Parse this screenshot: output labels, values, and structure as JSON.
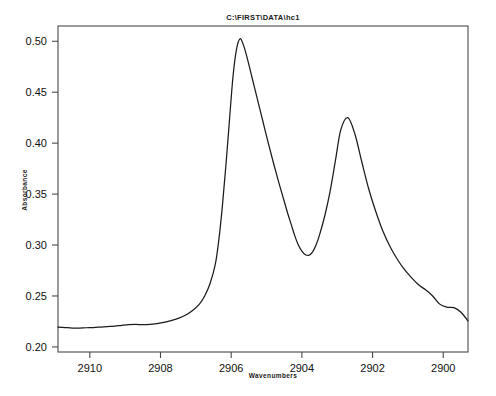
{
  "window": {
    "background": "#ffffff",
    "width": 496,
    "height": 396
  },
  "chart_data": {
    "type": "line",
    "title": "C:\\FIRST\\DATA\\hc1",
    "xlabel": "Wavenumbers",
    "ylabel": "Absorbance",
    "xlim": [
      2910.9,
      2899.3
    ],
    "ylim": [
      0.195,
      0.515
    ],
    "x_ticks": [
      "2910",
      "2908",
      "2906",
      "2904",
      "2902",
      "2900"
    ],
    "x_tick_values": [
      2910,
      2908,
      2906,
      2904,
      2902,
      2900
    ],
    "y_ticks": [
      "0.20",
      "0.25",
      "0.30",
      "0.35",
      "0.40",
      "0.45",
      "0.50"
    ],
    "y_tick_values": [
      0.2,
      0.25,
      0.3,
      0.35,
      0.4,
      0.45,
      0.5
    ],
    "x_axis_inverted": true,
    "grid": false,
    "legend": null,
    "series": [
      {
        "name": "hc1",
        "color": "#1b1b1b",
        "x": [
          2910.9,
          2910.7,
          2910.5,
          2910.3,
          2910.1,
          2909.9,
          2909.7,
          2909.5,
          2909.3,
          2909.1,
          2908.9,
          2908.7,
          2908.5,
          2908.3,
          2908.1,
          2907.9,
          2907.7,
          2907.5,
          2907.3,
          2907.1,
          2906.9,
          2906.75,
          2906.6,
          2906.45,
          2906.35,
          2906.25,
          2906.15,
          2906.05,
          2905.95,
          2905.85,
          2905.75,
          2905.65,
          2905.55,
          2905.45,
          2905.35,
          2905.25,
          2905.1,
          2904.95,
          2904.8,
          2904.65,
          2904.5,
          2904.4,
          2904.3,
          2904.2,
          2904.1,
          2904.0,
          2903.9,
          2903.8,
          2903.7,
          2903.6,
          2903.5,
          2903.35,
          2903.2,
          2903.05,
          2902.9,
          2902.7,
          2902.5,
          2902.3,
          2902.1,
          2901.9,
          2901.7,
          2901.5,
          2901.3,
          2901.1,
          2900.9,
          2900.7,
          2900.5,
          2900.3,
          2900.1,
          2899.9,
          2899.7,
          2899.5,
          2899.3
        ],
        "y": [
          0.2195,
          0.219,
          0.2185,
          0.2185,
          0.2188,
          0.219,
          0.2195,
          0.22,
          0.2205,
          0.2212,
          0.2218,
          0.222,
          0.2218,
          0.222,
          0.2228,
          0.224,
          0.2258,
          0.228,
          0.231,
          0.2355,
          0.242,
          0.25,
          0.262,
          0.281,
          0.305,
          0.338,
          0.378,
          0.422,
          0.465,
          0.492,
          0.5025,
          0.496,
          0.484,
          0.47,
          0.456,
          0.442,
          0.421,
          0.4,
          0.38,
          0.361,
          0.343,
          0.331,
          0.32,
          0.309,
          0.3,
          0.294,
          0.2905,
          0.29,
          0.293,
          0.3,
          0.31,
          0.329,
          0.353,
          0.383,
          0.413,
          0.425,
          0.409,
          0.381,
          0.354,
          0.332,
          0.313,
          0.298,
          0.286,
          0.276,
          0.268,
          0.261,
          0.256,
          0.25,
          0.242,
          0.239,
          0.2385,
          0.234,
          0.2255
        ]
      }
    ],
    "annotations": [
      {
        "label": "peak-1",
        "x": 2905.75,
        "y": 0.5025
      },
      {
        "label": "peak-2",
        "x": 2902.7,
        "y": 0.425
      },
      {
        "label": "valley",
        "x": 2903.8,
        "y": 0.29
      }
    ]
  },
  "geometry": {
    "plot_left": 58,
    "plot_top": 26,
    "plot_right": 468,
    "plot_bottom": 352
  }
}
